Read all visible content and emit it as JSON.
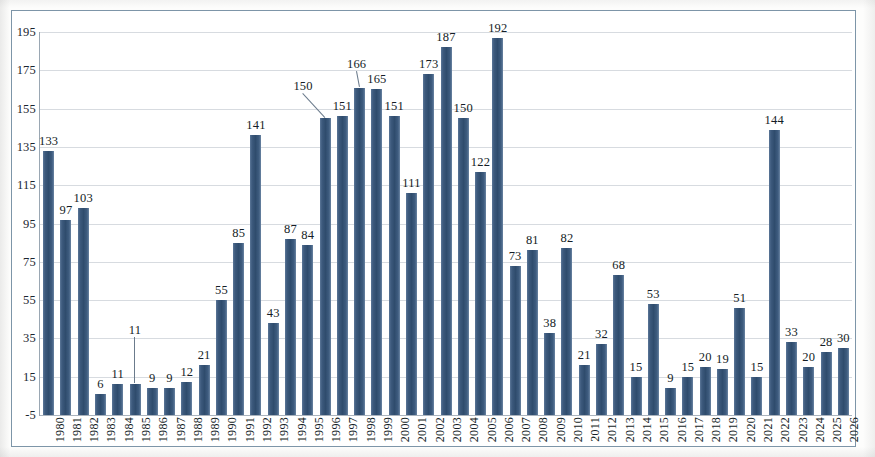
{
  "chart_data": {
    "type": "bar",
    "title": "",
    "subtitle": "",
    "xlabel": "",
    "ylabel": "",
    "ylim": [
      -5,
      195
    ],
    "ytick_step": 20,
    "yticks": [
      "-5",
      "15",
      "35",
      "55",
      "75",
      "95",
      "115",
      "135",
      "155",
      "175",
      "195"
    ],
    "grid": true,
    "legend": null,
    "legend_position": "none",
    "bar_color": "#35536f",
    "gridline_color": "#c9cfd6",
    "frame_color": "#7d95a8",
    "label_color": "#141d26",
    "categories": [
      "1980",
      "1981",
      "1982",
      "1983",
      "1984",
      "1985",
      "1986",
      "1987",
      "1988",
      "1989",
      "1990",
      "1991",
      "1992",
      "1993",
      "1994",
      "1995",
      "1996",
      "1997",
      "1998",
      "1999",
      "2000",
      "2001",
      "2002",
      "2003",
      "2004",
      "2005",
      "2006",
      "2007",
      "2008",
      "2009",
      "2010",
      "2011",
      "2012",
      "2013",
      "2014",
      "2015",
      "2016",
      "2017",
      "2018",
      "2019",
      "2020",
      "2021",
      "2022",
      "2023",
      "2024",
      "2025",
      "2026"
    ],
    "values": [
      133,
      97,
      103,
      6,
      11,
      11,
      9,
      9,
      12,
      21,
      55,
      85,
      141,
      43,
      87,
      84,
      150,
      151,
      166,
      165,
      151,
      111,
      173,
      187,
      150,
      122,
      192,
      73,
      81,
      38,
      82,
      21,
      32,
      68,
      15,
      53,
      9,
      15,
      20,
      19,
      51,
      15,
      144,
      33,
      20,
      28,
      30
    ],
    "data_labels": [
      "133",
      "97",
      "103",
      "6",
      "11",
      "11",
      "9",
      "9",
      "12",
      "21",
      "55",
      "85",
      "141",
      "43",
      "87",
      "84",
      "150",
      "151",
      "166",
      "165",
      "151",
      "111",
      "173",
      "187",
      "150",
      "122",
      "192",
      "73",
      "81",
      "38",
      "82",
      "21",
      "32",
      "68",
      "15",
      "53",
      "9",
      "15",
      "20",
      "19",
      "51",
      "15",
      "144",
      "33",
      "20",
      "28",
      "30"
    ],
    "leader_line_indices": [
      5,
      16,
      18
    ]
  }
}
